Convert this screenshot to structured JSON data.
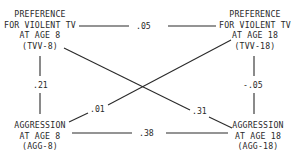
{
  "diagram": {
    "type": "cross-lagged panel correlation",
    "nodes": {
      "tvv8": {
        "lines": [
          "PREFERENCE",
          "FOR VIOLENT TV",
          "AT AGE 8",
          "(TVV-8)"
        ]
      },
      "tvv18": {
        "lines": [
          "PREFERENCE",
          "FOR VIOLENT TV",
          "AT AGE 18",
          "(TVV-18)"
        ]
      },
      "agg8": {
        "lines": [
          "AGGRESSION",
          "AT AGE 8",
          "(AGG-8)"
        ]
      },
      "agg18": {
        "lines": [
          "AGGRESSION",
          "AT AGE 18",
          "(AGG-18)"
        ]
      }
    },
    "edges": {
      "tvv8_tvv18": {
        "from": "TVV-8",
        "to": "TVV-18",
        "value": ".05"
      },
      "tvv8_agg8": {
        "from": "TVV-8",
        "to": "AGG-8",
        "value": ".21"
      },
      "tvv18_agg18": {
        "from": "TVV-18",
        "to": "AGG-18",
        "value": "-.05"
      },
      "agg8_agg18": {
        "from": "AGG-8",
        "to": "AGG-18",
        "value": ".38"
      },
      "agg8_tvv18": {
        "from": "AGG-8",
        "to": "TVV-18",
        "value": ".01"
      },
      "tvv8_agg18": {
        "from": "TVV-8",
        "to": "AGG-18",
        "value": ".31"
      }
    }
  }
}
